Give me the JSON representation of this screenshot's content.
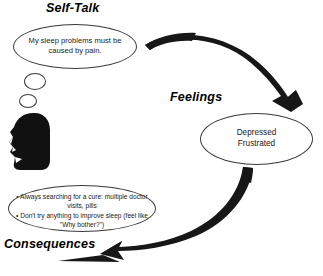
{
  "diagram": {
    "title_self_talk": "Self-Talk",
    "title_feelings": "Feelings",
    "title_consequences": "Consequences",
    "self_talk_bubble": "My sleep problems must be caused by pain.",
    "feelings_line_1": "Depressed",
    "feelings_line_2": "Frustrated",
    "consequence_bullet_1": "• Always searching for a cure:  multiple doctor visits, pills",
    "consequence_bullet_2": "• Don't try anything to improve sleep (feel like \"Why bother?\")",
    "colors": {
      "background": "#ffffff",
      "outline": "#3a3a3a",
      "arrow_fill": "#171717",
      "text": "#1a1a1a",
      "heading_text": "#000000",
      "silhouette": "#111111"
    },
    "icons": {
      "head_silhouette": "head-profile-silhouette",
      "arrow_top": "curved-arrow-self-talk-to-feelings",
      "arrow_bottom": "curved-arrow-feelings-to-consequences"
    }
  }
}
